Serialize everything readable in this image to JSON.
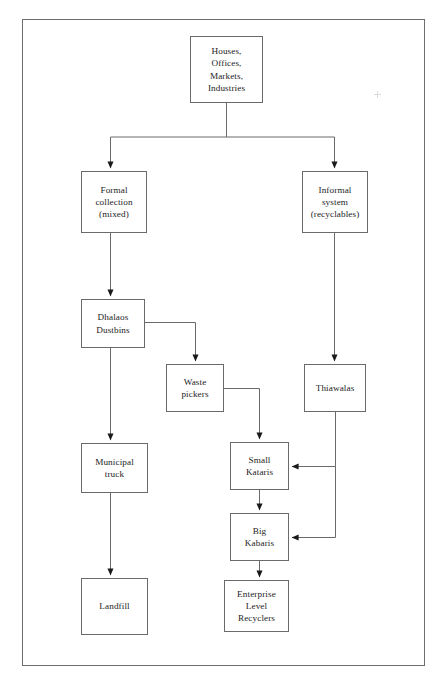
{
  "diagram": {
    "type": "flowchart",
    "orientation": "top-down",
    "line_color": "#6a6a6a",
    "arrow_color": "#1a1a1a",
    "background_color": "#ffffff",
    "border_color": "#6e6e6e",
    "nodes": [
      {
        "id": "sources",
        "label": "Houses,\nOffices,\nMarkets,\nIndustries",
        "x": 190,
        "y": 36,
        "w": 73,
        "h": 67
      },
      {
        "id": "formal",
        "label": "Formal\ncollection\n(mixed)",
        "x": 81,
        "y": 171,
        "w": 66,
        "h": 62
      },
      {
        "id": "informal",
        "label": "Informal\nsystem\n(recyclables)",
        "x": 302,
        "y": 171,
        "w": 66,
        "h": 62
      },
      {
        "id": "dhalaos",
        "label": "Dhalaos\nDustbins",
        "x": 81,
        "y": 299,
        "w": 64,
        "h": 49
      },
      {
        "id": "wastepick",
        "label": "Waste\npickers",
        "x": 166,
        "y": 364,
        "w": 58,
        "h": 48
      },
      {
        "id": "thiawalas",
        "label": "Thiawalas",
        "x": 304,
        "y": 364,
        "w": 62,
        "h": 48
      },
      {
        "id": "munitruck",
        "label": "Municipal\ntruck",
        "x": 81,
        "y": 443,
        "w": 67,
        "h": 50
      },
      {
        "id": "smallkat",
        "label": "Small\nKataris",
        "x": 230,
        "y": 442,
        "w": 59,
        "h": 48
      },
      {
        "id": "bigkab",
        "label": "Big\nKabaris",
        "x": 230,
        "y": 513,
        "w": 59,
        "h": 48
      },
      {
        "id": "landfill",
        "label": "Landfill",
        "x": 81,
        "y": 578,
        "w": 67,
        "h": 57
      },
      {
        "id": "enterprise",
        "label": "Enterprise\nLevel\nRecyclers",
        "x": 224,
        "y": 580,
        "w": 65,
        "h": 52
      }
    ],
    "edges": [
      {
        "from": "sources",
        "to": "formal",
        "kind": "split-left"
      },
      {
        "from": "sources",
        "to": "informal",
        "kind": "split-right"
      },
      {
        "from": "formal",
        "to": "dhalaos",
        "kind": "straight-down"
      },
      {
        "from": "informal",
        "to": "thiawalas",
        "kind": "straight-down"
      },
      {
        "from": "dhalaos",
        "to": "wastepick",
        "kind": "right-then-down"
      },
      {
        "from": "dhalaos",
        "to": "munitruck",
        "kind": "straight-down"
      },
      {
        "from": "wastepick",
        "to": "smallkat",
        "kind": "right-then-down"
      },
      {
        "from": "thiawalas",
        "to": "smallkat",
        "kind": "down-then-left"
      },
      {
        "from": "thiawalas",
        "to": "bigkab",
        "kind": "down-then-left"
      },
      {
        "from": "smallkat",
        "to": "bigkab",
        "kind": "straight-down"
      },
      {
        "from": "bigkab",
        "to": "enterprise",
        "kind": "straight-down"
      },
      {
        "from": "munitruck",
        "to": "landfill",
        "kind": "straight-down"
      }
    ]
  }
}
